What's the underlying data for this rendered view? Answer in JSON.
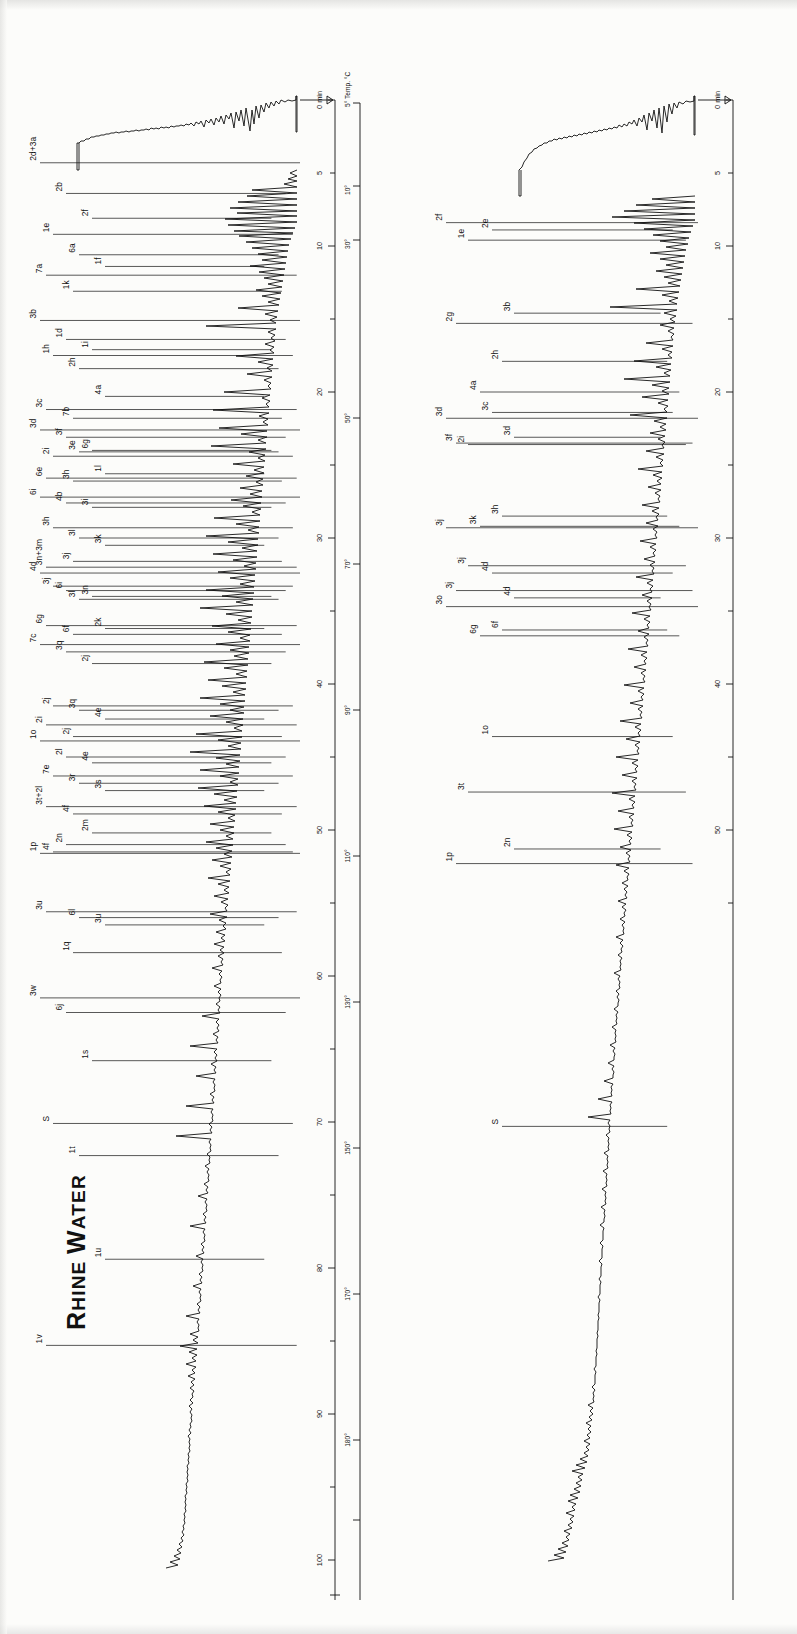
{
  "figure": {
    "kind": "gas-chromatogram-pair",
    "orientation": "rotated-90-ccw",
    "panels": [
      {
        "id": "rhine",
        "title_first": "R",
        "title_rest": "HINE ",
        "title_second": "W",
        "title_rest2": "ATER",
        "title_full": "RHINE WATER"
      },
      {
        "id": "sand-bank-filtrate",
        "title_first": "S",
        "title_rest": "AND ",
        "title_second": "B",
        "title_rest2": "ANK ",
        "title_third": "F",
        "title_rest3": "ILTRATE",
        "title_full": "SAND BANK FILTRATE"
      }
    ]
  },
  "axes": {
    "time": {
      "unit_label": "0 min",
      "ticks": [
        "0",
        "5",
        "10",
        "20",
        "30",
        "40",
        "50",
        "60",
        "70",
        "80",
        "90",
        "100"
      ],
      "minor_every": 5,
      "range": [
        0,
        103
      ]
    },
    "temperature": {
      "unit_label": "5° Temp. °C",
      "ticks": [
        "5°",
        "10°",
        "30°",
        "50°",
        "70°",
        "90°",
        "110°",
        "130°",
        "150°",
        "170°",
        "180°"
      ]
    }
  },
  "chart_data": {
    "type": "line",
    "xlabel": "Retention time (min) / Column temperature (°C)",
    "ylabel": "Detector response",
    "xlim": [
      0,
      103
    ],
    "ylim": [
      0,
      1
    ],
    "grid": false,
    "legend": "none",
    "series": [
      {
        "name": "Rhine Water",
        "peak_labels": [
          {
            "label": "2d+3a",
            "t": 4.3
          },
          {
            "label": "2b",
            "t": 6.4
          },
          {
            "label": "2f",
            "t": 8.1
          },
          {
            "label": "1e",
            "t": 9.2
          },
          {
            "label": "6a",
            "t": 10.6
          },
          {
            "label": "1f",
            "t": 11.4
          },
          {
            "label": "7a",
            "t": 12.0
          },
          {
            "label": "1k",
            "t": 13.1
          },
          {
            "label": "3b",
            "t": 15.1
          },
          {
            "label": "1d",
            "t": 16.4
          },
          {
            "label": "1i",
            "t": 17.1
          },
          {
            "label": "1h",
            "t": 17.5
          },
          {
            "label": "2h",
            "t": 18.4
          },
          {
            "label": "4a",
            "t": 20.3
          },
          {
            "label": "3c",
            "t": 21.2
          },
          {
            "label": "7b",
            "t": 21.8
          },
          {
            "label": "3d",
            "t": 22.6
          },
          {
            "label": "3f",
            "t": 23.1
          },
          {
            "label": "6g",
            "t": 24.0
          },
          {
            "label": "2i",
            "t": 24.4
          },
          {
            "label": "3e",
            "t": 24.1
          },
          {
            "label": "1l",
            "t": 25.6
          },
          {
            "label": "6e",
            "t": 25.9
          },
          {
            "label": "3h",
            "t": 26.1
          },
          {
            "label": "6i",
            "t": 27.2
          },
          {
            "label": "4b",
            "t": 27.6
          },
          {
            "label": "3i",
            "t": 27.9
          },
          {
            "label": "3h",
            "t": 29.3
          },
          {
            "label": "3l",
            "t": 30.0
          },
          {
            "label": "3k",
            "t": 30.5
          },
          {
            "label": "3n+3m",
            "t": 32.0
          },
          {
            "label": "3j",
            "t": 31.6
          },
          {
            "label": "4d",
            "t": 32.4
          },
          {
            "label": "6i",
            "t": 33.6
          },
          {
            "label": "3n",
            "t": 34.0
          },
          {
            "label": "3j",
            "t": 33.3
          },
          {
            "label": "3l",
            "t": 34.2
          },
          {
            "label": "2k",
            "t": 36.2
          },
          {
            "label": "6g",
            "t": 36.0
          },
          {
            "label": "6f",
            "t": 36.6
          },
          {
            "label": "7c",
            "t": 37.3
          },
          {
            "label": "3q",
            "t": 37.8
          },
          {
            "label": "2j",
            "t": 38.6
          },
          {
            "label": "2j",
            "t": 41.5
          },
          {
            "label": "3q",
            "t": 41.8
          },
          {
            "label": "4e",
            "t": 42.4
          },
          {
            "label": "2i",
            "t": 42.8
          },
          {
            "label": "2j",
            "t": 43.6
          },
          {
            "label": "1o",
            "t": 43.9
          },
          {
            "label": "2l",
            "t": 45.0
          },
          {
            "label": "4e",
            "t": 45.4
          },
          {
            "label": "7e",
            "t": 46.3
          },
          {
            "label": "3r",
            "t": 46.8
          },
          {
            "label": "3s",
            "t": 47.3
          },
          {
            "label": "3t+2l",
            "t": 48.4
          },
          {
            "label": "4f",
            "t": 48.9
          },
          {
            "label": "1p",
            "t": 51.6
          },
          {
            "label": "2n",
            "t": 51.0
          },
          {
            "label": "2m",
            "t": 50.2
          },
          {
            "label": "4f",
            "t": 51.5
          },
          {
            "label": "6l",
            "t": 56.0
          },
          {
            "label": "3u",
            "t": 56.5
          },
          {
            "label": "3u",
            "t": 55.6
          },
          {
            "label": "1q",
            "t": 58.4
          },
          {
            "label": "3w",
            "t": 61.5
          },
          {
            "label": "6j",
            "t": 62.5
          },
          {
            "label": "1s",
            "t": 65.8
          },
          {
            "label": "S",
            "t": 70.1
          },
          {
            "label": "1t",
            "t": 72.3
          },
          {
            "label": "1u",
            "t": 79.4
          },
          {
            "label": "1v",
            "t": 85.3
          }
        ]
      },
      {
        "name": "Sand Bank Filtrate",
        "peak_labels": [
          {
            "label": "2f",
            "t": 8.4
          },
          {
            "label": "2e",
            "t": 8.9
          },
          {
            "label": "1e",
            "t": 9.6
          },
          {
            "label": "3b",
            "t": 14.6
          },
          {
            "label": "2g",
            "t": 15.3
          },
          {
            "label": "2h",
            "t": 17.9
          },
          {
            "label": "4a",
            "t": 20.0
          },
          {
            "label": "3d",
            "t": 21.8
          },
          {
            "label": "3c",
            "t": 21.4
          },
          {
            "label": "2i",
            "t": 23.6
          },
          {
            "label": "3d",
            "t": 23.1
          },
          {
            "label": "3f",
            "t": 23.5
          },
          {
            "label": "3h",
            "t": 28.5
          },
          {
            "label": "3k",
            "t": 29.2
          },
          {
            "label": "3j",
            "t": 29.3
          },
          {
            "label": "4d",
            "t": 32.4
          },
          {
            "label": "3j",
            "t": 31.9
          },
          {
            "label": "4d",
            "t": 34.1
          },
          {
            "label": "3j",
            "t": 33.6
          },
          {
            "label": "6f",
            "t": 36.3
          },
          {
            "label": "6g",
            "t": 36.7
          },
          {
            "label": "3o",
            "t": 34.7
          },
          {
            "label": "1o",
            "t": 43.6
          },
          {
            "label": "3t",
            "t": 47.4
          },
          {
            "label": "2n",
            "t": 51.3
          },
          {
            "label": "1p",
            "t": 52.3
          },
          {
            "label": "S",
            "t": 70.3
          }
        ]
      }
    ]
  }
}
